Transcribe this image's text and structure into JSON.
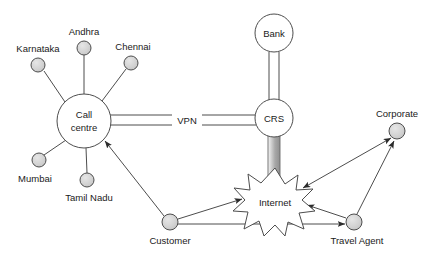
{
  "diagram": {
    "canvas": {
      "width": 436,
      "height": 257,
      "background": "#ffffff"
    },
    "style": {
      "node_fill": "#d4d4d4",
      "node_stroke": "#4d4d4d",
      "hub_fill": "#ffffff",
      "hub_stroke": "#4d4d4d",
      "line_color": "#4d4d4d",
      "band_light": "#f2f2f2",
      "band_dark": "#9e9e9e",
      "text_color": "#1a1a1a"
    },
    "nodes": [
      {
        "id": "karnataka",
        "label": "Karnataka",
        "type": "endpoint",
        "x": 38,
        "y": 65,
        "r": 7,
        "label_x": 38,
        "label_y": 52,
        "label_anchor": "middle"
      },
      {
        "id": "andhra",
        "label": "Andhra",
        "type": "endpoint",
        "x": 84,
        "y": 48,
        "r": 7,
        "label_x": 84,
        "label_y": 35,
        "label_anchor": "middle"
      },
      {
        "id": "chennai",
        "label": "Chennai",
        "type": "endpoint",
        "x": 131,
        "y": 63,
        "r": 7,
        "label_x": 131,
        "label_y": 50,
        "label_anchor": "middle"
      },
      {
        "id": "mumbai",
        "label": "Mumbai",
        "type": "endpoint",
        "x": 39,
        "y": 160,
        "r": 7,
        "label_x": 35,
        "label_y": 182,
        "label_anchor": "middle"
      },
      {
        "id": "tamil-nadu",
        "label": "Tamil Nadu",
        "type": "endpoint",
        "x": 87,
        "y": 180,
        "r": 7,
        "label_x": 89,
        "label_y": 201,
        "label_anchor": "middle"
      },
      {
        "id": "call-centre",
        "label": "Call centre",
        "type": "hub",
        "x": 84,
        "y": 121,
        "r": 27,
        "label_x": 84,
        "label_y": 118,
        "label_anchor": "middle"
      },
      {
        "id": "bank",
        "label": "Bank",
        "type": "hub",
        "x": 274,
        "y": 33,
        "r": 19,
        "label_x": 274,
        "label_y": 36,
        "label_anchor": "middle"
      },
      {
        "id": "crs",
        "label": "CRS",
        "type": "hub",
        "x": 274,
        "y": 118,
        "r": 19,
        "label_x": 274,
        "label_y": 121,
        "label_anchor": "middle"
      },
      {
        "id": "internet",
        "label": "Internet",
        "type": "cloud",
        "x": 275,
        "y": 202,
        "r": 33,
        "label_x": 275,
        "label_y": 203,
        "label_anchor": "middle"
      },
      {
        "id": "customer",
        "label": "Customer",
        "type": "endpoint",
        "x": 170,
        "y": 222,
        "r": 8,
        "label_x": 170,
        "label_y": 243,
        "label_anchor": "middle"
      },
      {
        "id": "travel-agent",
        "label": "Travel Agent",
        "type": "endpoint",
        "x": 354,
        "y": 222,
        "r": 8,
        "label_x": 357,
        "label_y": 243,
        "label_anchor": "middle"
      },
      {
        "id": "corporate",
        "label": "Corporate",
        "type": "endpoint",
        "x": 397,
        "y": 131,
        "r": 8,
        "label_x": 397,
        "label_y": 118,
        "label_anchor": "middle"
      }
    ],
    "links": [
      {
        "id": "karnataka-call-centre",
        "from": "karnataka",
        "to": "call-centre",
        "style": "plain",
        "arrow": "none"
      },
      {
        "id": "andhra-call-centre",
        "from": "andhra",
        "to": "call-centre",
        "style": "plain",
        "arrow": "none"
      },
      {
        "id": "chennai-call-centre",
        "from": "chennai",
        "to": "call-centre",
        "style": "plain",
        "arrow": "none"
      },
      {
        "id": "mumbai-call-centre",
        "from": "mumbai",
        "to": "call-centre",
        "style": "plain",
        "arrow": "none"
      },
      {
        "id": "tamil-nadu-call-centre",
        "from": "tamil-nadu",
        "to": "call-centre",
        "style": "plain",
        "arrow": "none"
      },
      {
        "id": "call-centre-crs",
        "from": "call-centre",
        "to": "crs",
        "style": "double",
        "arrow": "none",
        "label": "VPN",
        "label_x": 186,
        "label_y": 121
      },
      {
        "id": "bank-crs",
        "from": "bank",
        "to": "crs",
        "style": "double",
        "arrow": "none"
      },
      {
        "id": "crs-internet",
        "from": "crs",
        "to": "internet",
        "style": "band",
        "arrow": "none"
      },
      {
        "id": "customer-call-centre",
        "from": "customer",
        "to": "call-centre",
        "style": "plain",
        "arrow": "end"
      },
      {
        "id": "customer-internet",
        "from": "customer",
        "to": "internet",
        "style": "plain",
        "arrow": "end"
      },
      {
        "id": "customer-travel-agent",
        "from": "customer",
        "to": "travel-agent",
        "style": "plain",
        "arrow": "end"
      },
      {
        "id": "travel-agent-internet",
        "from": "travel-agent",
        "to": "internet",
        "style": "plain",
        "arrow": "end"
      },
      {
        "id": "internet-corporate",
        "from": "internet",
        "to": "corporate",
        "style": "plain",
        "arrow": "both"
      },
      {
        "id": "travel-agent-corporate",
        "from": "travel-agent",
        "to": "corporate",
        "style": "plain",
        "arrow": "end"
      }
    ]
  }
}
